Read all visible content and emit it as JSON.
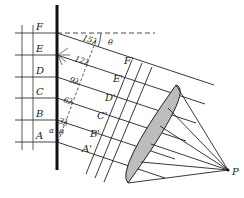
{
  "figure": {
    "left_labels": [
      "F",
      "E",
      "D",
      "C",
      "B",
      "A"
    ],
    "path_labels": [
      "15λ",
      "12λ",
      "9λ",
      "6λ",
      "3λ"
    ],
    "primed_labels": [
      "F'",
      "E'",
      "D'",
      "C'",
      "B'",
      "A'"
    ],
    "angle_label": "θ",
    "slit_label": "a",
    "slit_angle_label": "θ",
    "point_label": "P",
    "colors": {
      "line": "#222222",
      "lens": "#bdbdbd",
      "screen": "#111111"
    }
  }
}
